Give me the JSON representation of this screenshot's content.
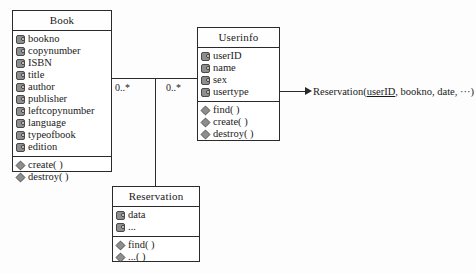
{
  "diagram": {
    "type": "uml-class-diagram",
    "classes": [
      {
        "id": "book",
        "name": "Book",
        "attributes": [
          "bookno",
          "copynumber",
          "ISBN",
          "title",
          "author",
          "publisher",
          "leftcopynumber",
          "language",
          "typeofbook",
          "edition"
        ],
        "operations": [
          "create( )",
          "destroy( )"
        ]
      },
      {
        "id": "userinfo",
        "name": "Userinfo",
        "attributes": [
          "userID",
          "name",
          "sex",
          "usertype"
        ],
        "operations": [
          "find( )",
          "create( )",
          "destroy( )"
        ]
      },
      {
        "id": "reservation",
        "name": "Reservation",
        "attributes": [
          "data",
          "..."
        ],
        "operations": [
          "find( )",
          "...( )"
        ]
      }
    ],
    "multiplicities": {
      "book_side": "0..*",
      "userinfo_side": "0..*"
    },
    "annotation": {
      "prefix": "Reservation(",
      "key": "userID",
      "rest": ", bookno, date, ···)"
    },
    "colors": {
      "stroke": "#2a2a2a",
      "icon_fill": "#8e8e8e",
      "background": "#fdfdfd"
    }
  }
}
